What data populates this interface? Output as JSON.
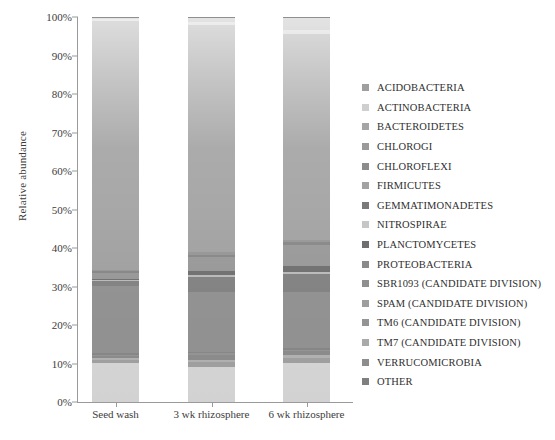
{
  "chart_data": {
    "type": "bar",
    "subtype": "stacked-bar-100-percent",
    "title": "",
    "xlabel": "",
    "ylabel": "Relative abundance",
    "categories": [
      "Seed wash",
      "3 wk rhizosphere",
      "6 wk rhizosphere"
    ],
    "ylim": [
      0,
      100
    ],
    "ytick_labels": [
      "100%",
      "90%",
      "80%",
      "70%",
      "60%",
      "50%",
      "40%",
      "30%",
      "20%",
      "10%",
      "0%"
    ],
    "ytick_values": [
      100,
      90,
      80,
      70,
      60,
      50,
      40,
      30,
      20,
      10,
      0
    ],
    "grid": false,
    "legend_position": "right",
    "units": "percent",
    "series": [
      {
        "name": "ACIDOBACTERIA",
        "color": "#b7b7b7",
        "values": [
          0.6,
          1.2,
          3.4
        ]
      },
      {
        "name": "ACTINOBACTERIA",
        "color": "#d2d2d2",
        "values": [
          0.5,
          0.8,
          0.9
        ]
      },
      {
        "name": "BACTEROIDETES",
        "color": "#a8a8a8",
        "values": [
          64.5,
          59.0,
          53.5
        ]
      },
      {
        "name": "CHLOROGI",
        "color": "#9d9d9d",
        "values": [
          0.4,
          0.7,
          0.6
        ]
      },
      {
        "name": "CHLOROFLEXI",
        "color": "#8e8e8e",
        "values": [
          0.4,
          0.6,
          0.8
        ]
      },
      {
        "name": "FIRMICUTES",
        "color": "#a0a0a0",
        "values": [
          1.6,
          3.6,
          5.6
        ]
      },
      {
        "name": "GEMMATIMONADETES",
        "color": "#777777",
        "values": [
          0.4,
          1.1,
          1.4
        ]
      },
      {
        "name": "NITROSPIRAE",
        "color": "#c3c3c3",
        "values": [
          0.3,
          0.6,
          0.7
        ]
      },
      {
        "name": "PLANCTOMYCETES",
        "color": "#8a8a8a",
        "values": [
          1.2,
          3.8,
          4.6
        ]
      },
      {
        "name": "PROTEOBACTERIA",
        "color": "#9a9a9a",
        "values": [
          17.4,
          15.5,
          14.5
        ]
      },
      {
        "name": "SBR1093 (CANDIDATE DIVISION)",
        "color": "#8f8f8f",
        "values": [
          0.4,
          0.5,
          0.5
        ]
      },
      {
        "name": "SPAM (CANDIDATE DIVISION)",
        "color": "#9e9e9e",
        "values": [
          0.3,
          0.4,
          0.4
        ]
      },
      {
        "name": "TM6 (CANDIDATE DIVISION)",
        "color": "#949494",
        "values": [
          0.5,
          1.2,
          1.0
        ]
      },
      {
        "name": "TM7 (CANDIDATE DIVISION)",
        "color": "#bcbcbc",
        "values": [
          0.5,
          0.7,
          0.6
        ]
      },
      {
        "name": "VERRUCOMICROBIA",
        "color": "#aaaaaa",
        "values": [
          1.0,
          1.3,
          1.5
        ]
      },
      {
        "name": "OTHER",
        "color": "#e2e2e2",
        "values": [
          10.0,
          9.0,
          10.0
        ]
      }
    ]
  },
  "legend": {
    "items": [
      {
        "label": "ACIDOBACTERIA",
        "color": "#9f9f9f"
      },
      {
        "label": "ACTINOBACTERIA",
        "color": "#cfcfcf"
      },
      {
        "label": "BACTEROIDETES",
        "color": "#a5a5a5"
      },
      {
        "label": "CHLOROGI",
        "color": "#9a9a9a"
      },
      {
        "label": "CHLOROFLEXI",
        "color": "#8c8c8c"
      },
      {
        "label": "FIRMICUTES",
        "color": "#a2a2a2"
      },
      {
        "label": "GEMMATIMONADETES",
        "color": "#7a7a7a"
      },
      {
        "label": "NITROSPIRAE",
        "color": "#c6c6c6"
      },
      {
        "label": "PLANCTOMYCETES",
        "color": "#6f6f6f"
      },
      {
        "label": "PROTEOBACTERIA",
        "color": "#8a8a8a"
      },
      {
        "label": "SBR1093 (CANDIDATE DIVISION)",
        "color": "#8f8f8f"
      },
      {
        "label": "SPAM (CANDIDATE DIVISION)",
        "color": "#9e9e9e"
      },
      {
        "label": "TM6 (CANDIDATE DIVISION)",
        "color": "#949494"
      },
      {
        "label": "TM7 (CANDIDATE DIVISION)",
        "color": "#a9a9a9"
      },
      {
        "label": "VERRUCOMICROBIA",
        "color": "#8d8d8d"
      },
      {
        "label": "OTHER",
        "color": "#7f7f7f"
      }
    ]
  },
  "axes": {
    "y_title": "Relative abundance"
  }
}
